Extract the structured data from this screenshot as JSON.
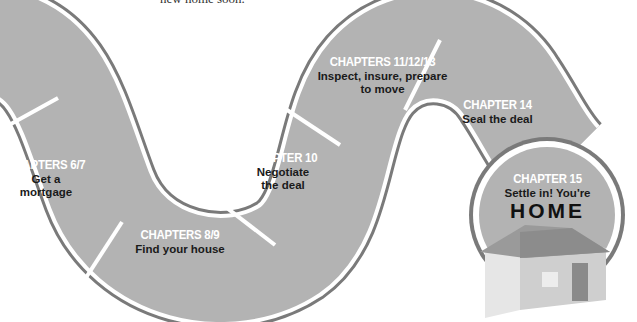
{
  "caption": {
    "text": "new home soon."
  },
  "colors": {
    "path_fill": "#b3b3b3",
    "path_stroke": "#7a7a7a",
    "divider": "#ffffff",
    "chapter_text": "#ffffff",
    "desc_text": "#1a1a1a"
  },
  "steps": [
    {
      "chapter": "CHAPTERS 6/7",
      "description": "Get a mortgage",
      "line1": "Get a",
      "line2": "mortgage"
    },
    {
      "chapter": "CHAPTERS 8/9",
      "description": "Find your house"
    },
    {
      "chapter": "CHAPTER 10",
      "description": "Negotiate the deal",
      "line1": "Negotiate",
      "line2": "the deal"
    },
    {
      "chapter": "CHAPTERS 11/12/13",
      "description": "Inspect, insure, prepare to move",
      "line1": "Inspect, insure, prepare",
      "line2": "to move"
    },
    {
      "chapter": "CHAPTER 14",
      "description": "Seal the deal"
    },
    {
      "chapter": "CHAPTER 15",
      "description": "Settle in! You're",
      "emphasis": "HOME"
    }
  ],
  "icons": {
    "house": "house-icon"
  }
}
